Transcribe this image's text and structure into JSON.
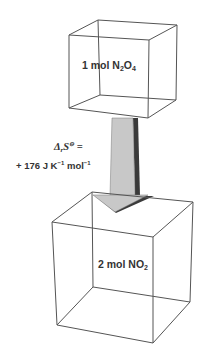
{
  "top_box": {
    "label_prefix": "1 mol N",
    "sub1": "2",
    "label_mid": "O",
    "sub2": "4"
  },
  "bottom_box": {
    "label_prefix": "2 mol NO",
    "sub1": "2"
  },
  "arrow": {
    "symbol_main": "Δ",
    "symbol_sub": "r",
    "symbol_s": "S",
    "symbol_sup": "⊖",
    "equals": " =",
    "value": "+ 176 J K",
    "exp1": "−1",
    "unit2": " mol",
    "exp2": "−1"
  },
  "colors": {
    "line": "#555555",
    "arrow_fill": "#c8c8c8",
    "arrow_shadow": "#3a3a3a",
    "text": "#333333"
  }
}
